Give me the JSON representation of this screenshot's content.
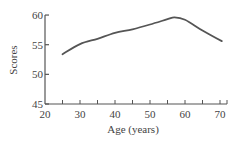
{
  "chart_data": {
    "type": "line",
    "title": "",
    "xlabel": "Age (years)",
    "ylabel": "Scores",
    "xlim": [
      20,
      72
    ],
    "ylim": [
      45,
      60
    ],
    "x_ticks": [
      20,
      30,
      40,
      50,
      60,
      70
    ],
    "x_minor_ticks": [
      25,
      30,
      35,
      40,
      45,
      50,
      55,
      60,
      65,
      70
    ],
    "y_ticks": [
      45,
      50,
      55,
      60
    ],
    "grid": false,
    "legend": null,
    "series": [
      {
        "name": "Scores",
        "color": "#555555",
        "x": [
          25,
          30,
          35,
          40,
          45,
          50,
          55,
          57,
          60,
          65,
          70.5
        ],
        "values": [
          53.4,
          55.1,
          56.0,
          57.0,
          57.6,
          58.4,
          59.3,
          59.6,
          59.2,
          57.4,
          55.6
        ]
      }
    ]
  },
  "colors": {
    "axis": "#555555",
    "text": "#444444",
    "line": "#555555"
  }
}
